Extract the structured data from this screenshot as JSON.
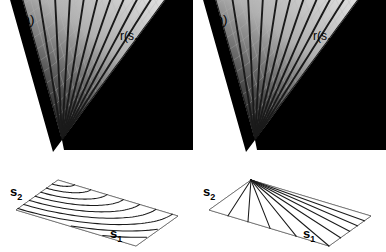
{
  "figure": {
    "background": "#ffffff",
    "width": 386,
    "height": 252,
    "caption_style": "two-panel 3d surface plot"
  },
  "colors": {
    "surface_dark": "#111111",
    "surface_light": "#f2f2f2",
    "mesh": "#b9b9b9",
    "contour": "#1a1a1a",
    "shadow_black": "#000000",
    "base_outline": "#555555",
    "base_contour": "#1a1a1a",
    "text": "#000000"
  },
  "panels": [
    {
      "id": "a",
      "tag": "(a)",
      "z_label": {
        "prefix": "r(s",
        "sub1": "1",
        "mid": ",s",
        "sub2": "2",
        "suffix": ")",
        "full": "r(s1,s2)"
      },
      "axes": {
        "x": {
          "label": "s",
          "sub": "1",
          "full": "s1"
        },
        "y": {
          "label": "s",
          "sub": "2",
          "full": "s2"
        }
      },
      "base_contour_type": "arc",
      "base_contour_count": 9,
      "surface_contour_count": 11,
      "mesh_lines_u": 17,
      "mesh_lines_v": 15
    },
    {
      "id": "b",
      "tag": "(b)",
      "z_label": {
        "prefix": "r(s",
        "sub1": "1",
        "mid": ",s",
        "sub2": "2",
        "suffix": ")",
        "full": "r(s1,s2)"
      },
      "axes": {
        "x": {
          "label": "s",
          "sub": "1",
          "full": "s1"
        },
        "y": {
          "label": "s",
          "sub": "2",
          "full": "s2"
        }
      },
      "base_contour_type": "line",
      "base_contour_count": 9,
      "surface_contour_count": 11,
      "mesh_lines_u": 17,
      "mesh_lines_v": 15
    }
  ],
  "chart_data": {
    "type": "line",
    "title": "",
    "xlabel": "s1",
    "ylabel": "s2",
    "zlabel": "r(s1,s2)",
    "panels": [
      {
        "name": "(a)",
        "base_contours": "concentric circular arcs centered at origin (Euclidean r = sqrt(s1^2+s2^2))",
        "contour_levels": [
          0.1,
          0.2,
          0.3,
          0.4,
          0.5,
          0.6,
          0.7,
          0.8,
          0.9
        ],
        "surface_rays": 11
      },
      {
        "name": "(b)",
        "base_contours": "straight lines fanning from origin (non-Euclidean / anisotropic metric)",
        "contour_levels": [
          0.1,
          0.2,
          0.3,
          0.4,
          0.5,
          0.6,
          0.7,
          0.8,
          0.9
        ],
        "surface_rays": 11
      }
    ],
    "legend": [],
    "grid": true
  }
}
